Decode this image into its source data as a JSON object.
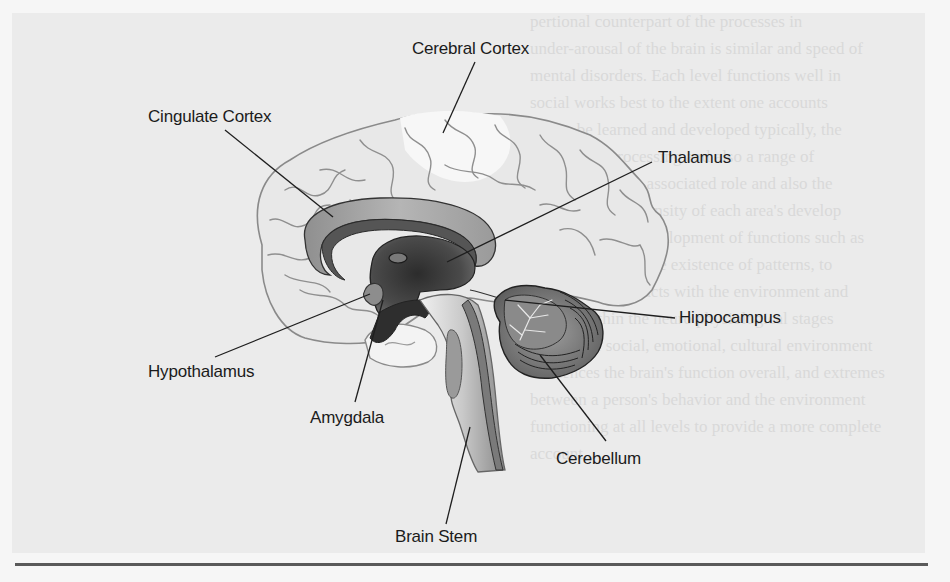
{
  "figure": {
    "type": "anatomical-diagram",
    "labels": [
      {
        "id": "cerebral-cortex",
        "text": "Cerebral Cortex"
      },
      {
        "id": "cingulate-cortex",
        "text": "Cingulate Cortex"
      },
      {
        "id": "thalamus",
        "text": "Thalamus"
      },
      {
        "id": "hippocampus",
        "text": "Hippocampus"
      },
      {
        "id": "hypothalamus",
        "text": "Hypothalamus"
      },
      {
        "id": "amygdala",
        "text": "Amygdala"
      },
      {
        "id": "cerebellum",
        "text": "Cerebellum"
      },
      {
        "id": "brain-stem",
        "text": "Brain Stem"
      }
    ]
  },
  "background_text": [
    "pertional counterpart of the processes in",
    "under-arousal of the brain is similar and speed of",
    "mental disorders. Each level functions well in",
    "social works best to the extent one accounts",
    "is it to be learned and developed typically, the",
    "multi-level processing and also a range of",
    "processes has an associated role and also the",
    "ways with the intensity of each area's develop",
    "experience and development of functions such as",
    "sets, one form is the existence of patterns, to",
    "The system interacts with the environment and",
    "factors within the neuro physiological stages",
    "times. The social, emotional, cultural environment",
    "influences the brain's function overall, and extremes",
    "between a person's behavior and the environment",
    "functioning at all levels to provide a more complete",
    "account..."
  ]
}
